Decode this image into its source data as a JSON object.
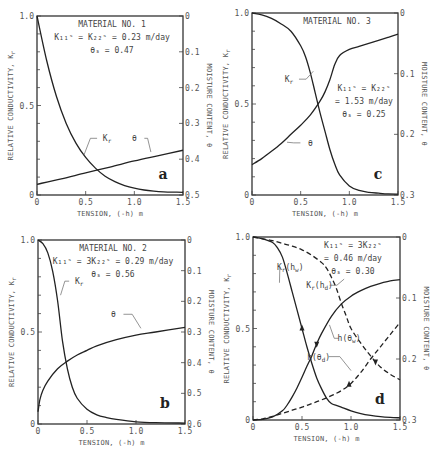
{
  "figure": {
    "x_axis_label": "TENSION, (-h) m",
    "left_axis_label": "RELATIVE CONDUCTIVITY, K",
    "left_axis_sub": "r",
    "right_axis_label": "MOISTURE CONTENT, θ"
  },
  "chart_data": [
    {
      "type": "line",
      "panel": "a",
      "title": "MATERIAL NO. 1",
      "annotations": [
        "K₁₁ˢ = K₂₂ˢ = 0.23 m/day",
        "θₛ = 0.47"
      ],
      "xlabel": "TENSION, (-h) m",
      "ylabel": "RELATIVE CONDUCTIVITY, Kr",
      "y2label": "MOISTURE CONTENT, θ",
      "xlim": [
        0,
        1.5
      ],
      "ylim": [
        0,
        1.0
      ],
      "y2lim": [
        0.5,
        0
      ],
      "xticks": [
        "0",
        "0.5",
        "1.0",
        "1.5"
      ],
      "yticks": [
        "0",
        "0.5",
        "1.0"
      ],
      "y2ticks": [
        "0",
        "0.1",
        "0.2",
        "0.3",
        "0.4",
        "0.5"
      ],
      "series": [
        {
          "name": "Kr",
          "axis": "left",
          "style": "solid",
          "x": [
            0,
            0.1,
            0.2,
            0.3,
            0.4,
            0.5,
            0.6,
            0.7,
            0.8,
            0.9,
            1.0,
            1.1,
            1.2,
            1.3,
            1.4,
            1.5
          ],
          "y": [
            1.0,
            0.75,
            0.55,
            0.4,
            0.29,
            0.21,
            0.15,
            0.105,
            0.075,
            0.053,
            0.038,
            0.028,
            0.022,
            0.018,
            0.016,
            0.015
          ]
        },
        {
          "name": "θ",
          "axis": "right",
          "style": "solid",
          "x": [
            0,
            0.25,
            0.5,
            0.75,
            1.0,
            1.25,
            1.5
          ],
          "y": [
            0.47,
            0.455,
            0.438,
            0.422,
            0.405,
            0.39,
            0.375
          ]
        }
      ],
      "labels": [
        {
          "text": "K",
          "sub": "r",
          "x": 0.72,
          "y": 0.3,
          "to_x": 0.48,
          "to_y": 0.22
        },
        {
          "text": "θ",
          "x": 1.0,
          "y": 0.3,
          "to_x": 1.17,
          "to_y": 0.24
        }
      ]
    },
    {
      "type": "line",
      "panel": "c",
      "title": "MATERIAL NO. 3",
      "annotations": [
        "K₁₁ˢ = K₂₂ˢ",
        "= 1.53 m/day",
        "θₛ = 0.25"
      ],
      "xlabel": "TENSION, (-h) m",
      "ylabel": "RELATIVE CONDUCTIVITY, Kr",
      "y2label": "MOISTURE CONTENT, θ",
      "xlim": [
        0,
        1.5
      ],
      "ylim": [
        0,
        1.0
      ],
      "y2lim": [
        0.3,
        0
      ],
      "xticks": [
        "0",
        "0.5",
        "1.0",
        "1.5"
      ],
      "yticks": [
        "0",
        "0.5",
        "1.0"
      ],
      "y2ticks": [
        "0",
        "0.1",
        "0.2",
        "0.3"
      ],
      "series": [
        {
          "name": "Kr",
          "axis": "left",
          "style": "solid",
          "x": [
            0,
            0.1,
            0.2,
            0.3,
            0.4,
            0.5,
            0.55,
            0.6,
            0.65,
            0.7,
            0.75,
            0.8,
            0.85,
            0.9,
            1.0,
            1.1,
            1.2,
            1.3,
            1.4,
            1.5
          ],
          "y": [
            1.0,
            0.99,
            0.97,
            0.94,
            0.9,
            0.82,
            0.76,
            0.67,
            0.56,
            0.45,
            0.35,
            0.25,
            0.17,
            0.11,
            0.05,
            0.025,
            0.015,
            0.01,
            0.006,
            0.005
          ]
        },
        {
          "name": "θ",
          "axis": "right",
          "style": "solid",
          "x": [
            0,
            0.1,
            0.2,
            0.3,
            0.4,
            0.5,
            0.6,
            0.7,
            0.75,
            0.8,
            0.85,
            0.9,
            1.0,
            1.1,
            1.2,
            1.3,
            1.4,
            1.5
          ],
          "y": [
            0.25,
            0.24,
            0.228,
            0.215,
            0.2,
            0.185,
            0.168,
            0.145,
            0.13,
            0.11,
            0.085,
            0.07,
            0.06,
            0.055,
            0.05,
            0.045,
            0.04,
            0.035
          ]
        }
      ],
      "labels": [
        {
          "text": "K",
          "sub": "r",
          "x": 0.38,
          "y": 0.62,
          "to_x": 0.63,
          "to_y": 0.68
        },
        {
          "text": "θ",
          "x": 0.6,
          "y": 0.27,
          "to_x": 0.36,
          "to_y": 0.29
        }
      ]
    },
    {
      "type": "line",
      "panel": "b",
      "title": "MATERIAL NO. 2",
      "annotations": [
        "K₁₁ˢ = 3K₂₂ˢ = 0.29 m/day",
        "θₛ = 0.56"
      ],
      "xlabel": "TENSION, (-h) m",
      "ylabel": "RELATIVE CONDUCTIVITY, Kr",
      "y2label": "MOISTURE CONTENT, θ",
      "xlim": [
        0,
        1.5
      ],
      "ylim": [
        0,
        1.0
      ],
      "y2lim": [
        0.6,
        0
      ],
      "xticks": [
        "0",
        "0.5",
        "1.0",
        "1.5"
      ],
      "yticks": [
        "0",
        "0.5",
        "1.0"
      ],
      "y2ticks": [
        "0",
        "0.1",
        "0.2",
        "0.3",
        "0.4",
        "0.5",
        "0.6"
      ],
      "series": [
        {
          "name": "Kr",
          "axis": "left",
          "style": "solid",
          "x": [
            0,
            0.05,
            0.1,
            0.15,
            0.2,
            0.25,
            0.3,
            0.35,
            0.4,
            0.5,
            0.6,
            0.7,
            0.8,
            1.0,
            1.2,
            1.5
          ],
          "y": [
            1.0,
            0.98,
            0.93,
            0.83,
            0.67,
            0.45,
            0.3,
            0.2,
            0.14,
            0.08,
            0.05,
            0.035,
            0.025,
            0.012,
            0.007,
            0.005
          ]
        },
        {
          "name": "θ",
          "axis": "right",
          "style": "solid",
          "x": [
            0,
            0.02,
            0.05,
            0.1,
            0.2,
            0.3,
            0.4,
            0.5,
            0.6,
            0.8,
            1.0,
            1.2,
            1.5
          ],
          "y": [
            0.56,
            0.52,
            0.49,
            0.46,
            0.42,
            0.395,
            0.375,
            0.36,
            0.345,
            0.325,
            0.31,
            0.3,
            0.285
          ]
        }
      ],
      "labels": [
        {
          "text": "K",
          "sub": "r",
          "x": 0.42,
          "y": 0.76,
          "to_x": 0.23,
          "to_y": 0.7
        },
        {
          "text": "θ",
          "x": 0.77,
          "y": 0.58,
          "to_x": 1.05,
          "to_y": 0.52
        }
      ]
    },
    {
      "type": "line",
      "panel": "d",
      "title": "",
      "annotations": [
        "K₁₁ˢ = 3K₂₂ˢ",
        "= 0.46 m/day",
        "θₛ = 0.30"
      ],
      "xlabel": "TENSION, (-h) m",
      "ylabel": "RELATIVE CONDUCTIVITY, Kr",
      "y2label": "MOISTURE CONTENT, θ",
      "xlim": [
        0,
        1.5
      ],
      "ylim": [
        0,
        1.0
      ],
      "y2lim": [
        0.3,
        0
      ],
      "xticks": [
        "0",
        "0.5",
        "1.0",
        "1.5"
      ],
      "yticks": [
        "0",
        "0.5",
        "1.0"
      ],
      "y2ticks": [
        "0",
        "0.1",
        "0.2",
        "0.3"
      ],
      "series": [
        {
          "name": "Kr(hw)",
          "axis": "left",
          "style": "solid",
          "x": [
            0,
            0.1,
            0.2,
            0.25,
            0.3,
            0.35,
            0.4,
            0.45,
            0.5,
            0.55,
            0.6,
            0.65,
            0.7,
            0.75,
            0.8,
            0.85,
            0.9,
            1.0,
            1.1,
            1.2,
            1.3,
            1.4,
            1.5
          ],
          "y": [
            1.0,
            0.99,
            0.97,
            0.94,
            0.89,
            0.8,
            0.7,
            0.6,
            0.5,
            0.4,
            0.31,
            0.23,
            0.17,
            0.12,
            0.09,
            0.08,
            0.07,
            0.05,
            0.035,
            0.025,
            0.018,
            0.014,
            0.012
          ]
        },
        {
          "name": "Kr(hd)",
          "axis": "left",
          "style": "dashed",
          "x": [
            0,
            0.1,
            0.2,
            0.3,
            0.4,
            0.5,
            0.6,
            0.7,
            0.75,
            0.8,
            0.85,
            0.9,
            0.95,
            1.0,
            1.1,
            1.2,
            1.3,
            1.4,
            1.5
          ],
          "y": [
            1.0,
            0.99,
            0.98,
            0.965,
            0.95,
            0.93,
            0.9,
            0.86,
            0.83,
            0.78,
            0.72,
            0.64,
            0.57,
            0.5,
            0.42,
            0.35,
            0.29,
            0.25,
            0.22
          ]
        },
        {
          "name": "h(θw)",
          "axis": "right",
          "style": "solid",
          "x": [
            0,
            0.1,
            0.2,
            0.3,
            0.35,
            0.4,
            0.45,
            0.5,
            0.55,
            0.6,
            0.65,
            0.7,
            0.8,
            0.9,
            1.0,
            1.1,
            1.2,
            1.3,
            1.4,
            1.5
          ],
          "y": [
            0.3,
            0.299,
            0.295,
            0.285,
            0.275,
            0.262,
            0.247,
            0.23,
            0.212,
            0.195,
            0.175,
            0.158,
            0.13,
            0.11,
            0.097,
            0.088,
            0.081,
            0.076,
            0.072,
            0.07
          ]
        },
        {
          "name": "h(θd)",
          "axis": "right",
          "style": "dashed",
          "x": [
            0,
            0.1,
            0.2,
            0.3,
            0.4,
            0.5,
            0.6,
            0.7,
            0.8,
            0.9,
            1.0,
            1.1,
            1.2,
            1.3,
            1.4,
            1.5
          ],
          "y": [
            0.3,
            0.298,
            0.294,
            0.289,
            0.284,
            0.279,
            0.273,
            0.267,
            0.26,
            0.252,
            0.24,
            0.222,
            0.2,
            0.18,
            0.16,
            0.14
          ]
        }
      ],
      "labels": [
        {
          "text": "K",
          "sub": "r",
          "tail": "(h",
          "tail_sub": "w",
          "end": ")",
          "x": 0.38,
          "y": 0.82,
          "to_x": 0.27,
          "to_y": 0.75
        },
        {
          "text": "K",
          "sub": "r",
          "tail": "(h",
          "tail_sub": "d",
          "end": ")",
          "x": 0.68,
          "y": 0.72,
          "to_x": 0.93,
          "to_y": 0.77
        },
        {
          "text": "h(θ",
          "sub": "w",
          "tail": ")",
          "x": 0.98,
          "y": 0.43,
          "to_x": 0.78,
          "to_y": 0.52
        },
        {
          "text": "h(θ",
          "sub": "d",
          "tail": ")",
          "x": 0.67,
          "y": 0.33,
          "to_x": 1.0,
          "to_y": 0.27
        }
      ],
      "arrows": [
        {
          "series": "Kr(hw)",
          "x": 0.5,
          "dir": "up"
        },
        {
          "series": "h(θw)",
          "x": 0.65,
          "dir": "down"
        },
        {
          "series": "Kr(hd)",
          "x": 1.25,
          "dir": "down"
        },
        {
          "series": "h(θd)",
          "x": 0.98,
          "dir": "up"
        }
      ]
    }
  ],
  "panels_layout": {
    "a": {
      "x0": 37,
      "x1": 183,
      "y0": 16,
      "y1": 195,
      "letter": "a"
    },
    "c": {
      "x0": 252,
      "x1": 398,
      "y0": 13,
      "y1": 195,
      "letter": "c"
    },
    "b": {
      "x0": 38,
      "x1": 185,
      "y0": 240,
      "y1": 424,
      "letter": "b"
    },
    "d": {
      "x0": 253,
      "x1": 400,
      "y0": 237,
      "y1": 420,
      "letter": "d"
    }
  }
}
